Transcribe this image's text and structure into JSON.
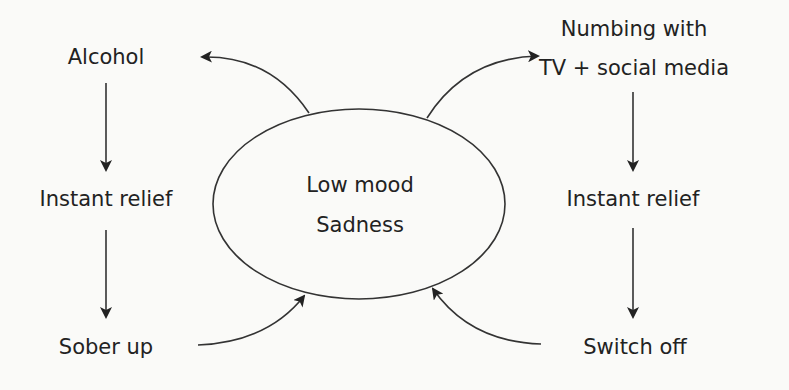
{
  "diagram": {
    "type": "cycle-diagram",
    "background": "#fafaf8",
    "ink_color": "#222222",
    "center": {
      "line1": "Low mood",
      "line2": "Sadness",
      "shape": "ellipse"
    },
    "left_cycle": {
      "steps": [
        "Alcohol",
        "Instant relief",
        "Sober up"
      ]
    },
    "right_cycle": {
      "steps_line1": "Numbing with",
      "steps_line2": "TV + social media",
      "step2": "Instant relief",
      "step3": "Switch off"
    },
    "edges": [
      {
        "from": "Low mood / Sadness",
        "to": "Alcohol"
      },
      {
        "from": "Alcohol",
        "to": "Instant relief"
      },
      {
        "from": "Instant relief",
        "to": "Sober up"
      },
      {
        "from": "Sober up",
        "to": "Low mood / Sadness"
      },
      {
        "from": "Low mood / Sadness",
        "to": "Numbing with TV + social media"
      },
      {
        "from": "Numbing with TV + social media",
        "to": "Instant relief"
      },
      {
        "from": "Instant relief",
        "to": "Switch off"
      },
      {
        "from": "Switch off",
        "to": "Low mood / Sadness"
      }
    ]
  }
}
